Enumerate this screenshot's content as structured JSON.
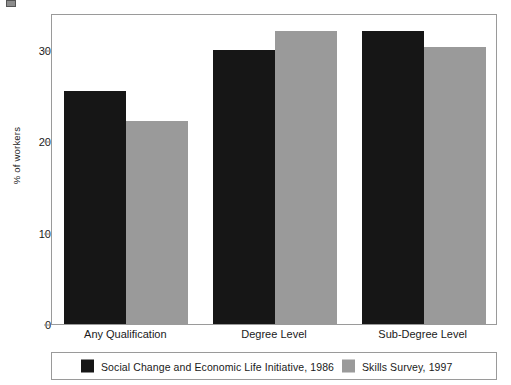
{
  "chart_data": {
    "type": "bar",
    "title": "",
    "subtitle": "",
    "xlabel": "",
    "ylabel": "% of workers",
    "ylim": [
      0,
      34
    ],
    "ytick_values": [
      0,
      10,
      20,
      30
    ],
    "ytick_labels": [
      "0",
      "10",
      "20",
      "30"
    ],
    "grid": false,
    "legend_position": "bottom",
    "categories": [
      "Any Qualification",
      "Degree Level",
      "Sub-Degree Level"
    ],
    "series": [
      {
        "name": "Social Change and Economic Life Initiative, 1986",
        "color": "#161616",
        "values": [
          25.5,
          30.0,
          32.0
        ]
      },
      {
        "name": "Skills Survey, 1997",
        "color": "#9a9a9a",
        "values": [
          22.2,
          32.0,
          30.3
        ]
      }
    ]
  },
  "colors": {
    "series_black": "#161616",
    "series_gray": "#9a9a9a",
    "axis": "#9a9a9a",
    "text": "#1a1a1a",
    "background": "#ffffff"
  }
}
